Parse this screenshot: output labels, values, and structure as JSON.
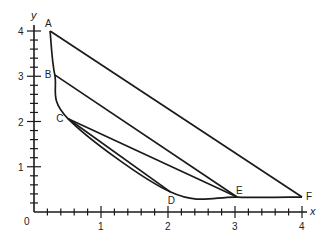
{
  "chart_data": {
    "type": "line",
    "title": "",
    "xlabel": "x",
    "ylabel": "y",
    "origin_label": "0",
    "xlim": [
      0,
      4.1
    ],
    "ylim": [
      0,
      4.2
    ],
    "grid": false,
    "x_ticks": [
      {
        "value": 1,
        "label": "1"
      },
      {
        "value": 2,
        "label": "2"
      },
      {
        "value": 3,
        "label": "3"
      },
      {
        "value": 4,
        "label": "4"
      }
    ],
    "y_ticks": [
      {
        "value": 1,
        "label": "1"
      },
      {
        "value": 2,
        "label": "2"
      },
      {
        "value": 3,
        "label": "3"
      },
      {
        "value": 4,
        "label": "4"
      }
    ],
    "minor_tick_step": 0.2,
    "points": [
      {
        "label": "A",
        "x": 0.24,
        "y": 4.0
      },
      {
        "label": "B",
        "x": 0.31,
        "y": 3.03
      },
      {
        "label": "C",
        "x": 0.51,
        "y": 2.06
      },
      {
        "label": "D",
        "x": 2.04,
        "y": 0.44
      },
      {
        "label": "E",
        "x": 3.03,
        "y": 0.33
      },
      {
        "label": "F",
        "x": 4.0,
        "y": 0.33
      }
    ],
    "curve": {
      "description": "convex decreasing curve through A, B, C, D, E, F",
      "through": [
        "A",
        "B",
        "C",
        "D",
        "E",
        "F"
      ]
    },
    "segments": [
      {
        "from": "A",
        "to": "F"
      },
      {
        "from": "B",
        "to": "E"
      },
      {
        "from": "C",
        "to": "E"
      },
      {
        "from": "C",
        "to": "D"
      }
    ],
    "line_color": "#1a1a1a"
  }
}
